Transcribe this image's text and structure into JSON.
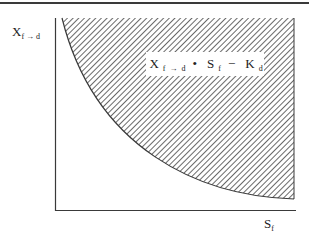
{
  "diagram": {
    "y_axis_label": {
      "main": "X",
      "sub": "f → d"
    },
    "x_axis_label": {
      "main": "S",
      "sub": "f"
    },
    "equation": {
      "term1": "X",
      "term1_sub": "f → d",
      "operator1": "•",
      "term2": "S",
      "term2_sub": "f",
      "operator2": "−",
      "term3": "K",
      "term3_sub": "d"
    },
    "region": "hatched area above hyperbolic curve (X·S ≥ K)",
    "colors": {
      "line": "#3a3a3a",
      "hatch": "#444444",
      "background": "#ffffff"
    }
  }
}
